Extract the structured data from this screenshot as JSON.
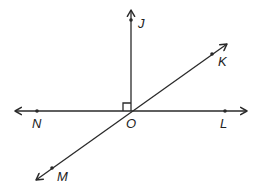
{
  "diagram": {
    "type": "geometry",
    "colors": {
      "line": "#2a2a2a",
      "label": "#222222",
      "background": "#ffffff"
    },
    "vertex": {
      "name": "O",
      "x": 131,
      "y": 111
    },
    "lines": [
      {
        "id": "line-NL",
        "kind": "line",
        "through": [
          "N",
          "L"
        ],
        "x1": 15,
        "y1": 111,
        "x2": 247,
        "y2": 111
      },
      {
        "id": "line-MK",
        "kind": "line",
        "through": [
          "M",
          "K"
        ],
        "x1": 36,
        "y1": 180,
        "x2": 227,
        "y2": 44
      },
      {
        "id": "ray-OJ",
        "kind": "ray",
        "from": "O",
        "through": "J",
        "x1": 131,
        "y1": 111,
        "x2": 131,
        "y2": 10
      }
    ],
    "points": [
      {
        "name": "J",
        "x": 131,
        "y": 20,
        "label_x": 138,
        "label_y": 28
      },
      {
        "name": "K",
        "x": 212,
        "y": 54,
        "label_x": 218,
        "label_y": 66
      },
      {
        "name": "N",
        "x": 37,
        "y": 111,
        "label_x": 32,
        "label_y": 128
      },
      {
        "name": "O",
        "x": 131,
        "y": 111,
        "label_x": 126,
        "label_y": 128
      },
      {
        "name": "L",
        "x": 225,
        "y": 111,
        "label_x": 220,
        "label_y": 128
      },
      {
        "name": "M",
        "x": 52,
        "y": 168,
        "label_x": 57,
        "label_y": 181
      }
    ],
    "right_angle": {
      "at": "O",
      "between": [
        "J",
        "N"
      ],
      "size": 8
    }
  }
}
